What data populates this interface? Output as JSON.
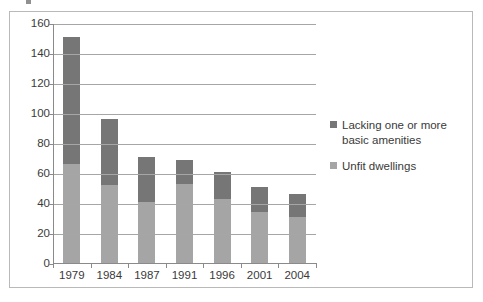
{
  "chart_data": {
    "type": "bar",
    "subtype": "stacked-bar",
    "title": "",
    "xlabel": "",
    "ylabel": "",
    "ylim": [
      0,
      160
    ],
    "ytick_step": 20,
    "ytick_labels": [
      "160",
      "140",
      "120",
      "100",
      "80",
      "60",
      "40",
      "20",
      "0"
    ],
    "grid": true,
    "legend_position": "right",
    "categories": [
      "1979",
      "1984",
      "1987",
      "1991",
      "1996",
      "2001",
      "2004"
    ],
    "series": [
      {
        "name": "Unfit dwellings",
        "color": "#a5a5a5",
        "values": [
          66,
          52,
          41,
          53,
          43,
          34,
          31
        ]
      },
      {
        "name": "Lacking one or more basic amenities",
        "color": "#767676",
        "values": [
          85,
          44,
          30,
          16,
          18,
          17,
          15
        ]
      }
    ],
    "totals": [
      151,
      96,
      71,
      69,
      61,
      51,
      46
    ]
  },
  "legend": {
    "items": [
      {
        "label": "Lacking one or more basic amenities",
        "color": "#767676"
      },
      {
        "label": "Unfit dwellings",
        "color": "#a5a5a5"
      }
    ]
  },
  "colors": {
    "series_dark": "#767676",
    "series_light": "#a5a5a5",
    "gridline": "#a6a6a6",
    "axis": "#8a8a8a",
    "frame_border": "#b9b9b9",
    "text": "#3a3a3a",
    "background": "#ffffff"
  }
}
